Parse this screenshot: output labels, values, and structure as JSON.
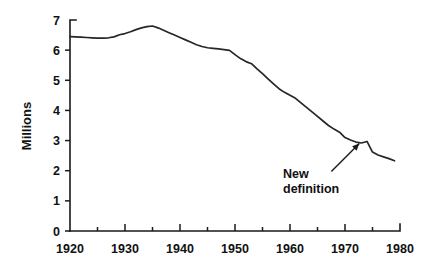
{
  "chart_data": {
    "type": "line",
    "title": "",
    "subtitle": "",
    "xlabel": "",
    "ylabel": "Millions",
    "xlim": [
      1920,
      1980
    ],
    "ylim": [
      0,
      7
    ],
    "grid": false,
    "legend": null,
    "x_ticks": [
      1920,
      1930,
      1940,
      1950,
      1960,
      1970,
      1980
    ],
    "x_tick_labels": [
      "1920",
      "1930",
      "1940",
      "1950",
      "1960",
      "1970",
      "1980"
    ],
    "x_minor_ticks": [
      1925,
      1935,
      1945,
      1955,
      1965,
      1975
    ],
    "y_ticks": [
      0,
      1,
      2,
      3,
      4,
      5,
      6,
      7
    ],
    "y_tick_labels": [
      "0",
      "1",
      "2",
      "3",
      "4",
      "5",
      "6",
      "7"
    ],
    "annotations": [
      {
        "name": "new-definition-annotation",
        "text_line1": "New",
        "text_line2": "definition",
        "points_to_x": 1972.6,
        "points_to_y": 2.97
      }
    ],
    "series": [
      {
        "name": "farms",
        "x": [
          1920,
          1921,
          1922,
          1923,
          1924,
          1925,
          1926,
          1927,
          1928,
          1929,
          1930,
          1931,
          1932,
          1933,
          1934,
          1935,
          1936,
          1937,
          1938,
          1939,
          1940,
          1941,
          1942,
          1943,
          1944,
          1945,
          1946,
          1947,
          1948,
          1949,
          1950,
          1951,
          1952,
          1953,
          1954,
          1955,
          1956,
          1957,
          1958,
          1959,
          1960,
          1961,
          1962,
          1963,
          1964,
          1965,
          1966,
          1967,
          1968,
          1969,
          1970,
          1971,
          1972,
          1973,
          1974,
          1975,
          1976,
          1977,
          1978,
          1979
        ],
        "y": [
          6.45,
          6.44,
          6.43,
          6.42,
          6.41,
          6.4,
          6.4,
          6.41,
          6.44,
          6.51,
          6.55,
          6.61,
          6.68,
          6.74,
          6.78,
          6.8,
          6.74,
          6.66,
          6.58,
          6.5,
          6.42,
          6.34,
          6.26,
          6.18,
          6.12,
          6.08,
          6.06,
          6.04,
          6.02,
          5.99,
          5.85,
          5.72,
          5.62,
          5.55,
          5.38,
          5.22,
          5.05,
          4.88,
          4.72,
          4.6,
          4.5,
          4.4,
          4.25,
          4.1,
          3.95,
          3.8,
          3.65,
          3.5,
          3.38,
          3.28,
          3.1,
          3.02,
          2.95,
          2.92,
          2.97,
          2.62,
          2.52,
          2.46,
          2.4,
          2.33
        ]
      }
    ]
  },
  "geometry": {
    "plot_left": 70,
    "plot_right": 400,
    "plot_top": 20,
    "plot_bottom": 231
  }
}
